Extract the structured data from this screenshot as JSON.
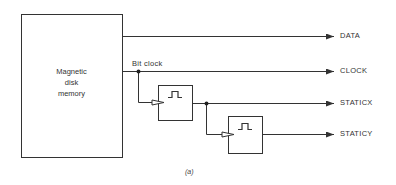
{
  "diagram": {
    "memory_block": {
      "line1": "Magnetic",
      "line2": "disk",
      "line3": "memory"
    },
    "signals": {
      "bit_clock": "Bit clock",
      "outputs": [
        "DATA",
        "CLOCK",
        "STATICX",
        "STATICY"
      ]
    },
    "caption": "(a)",
    "colors": {
      "line": "#333333",
      "background": "#ffffff"
    }
  }
}
